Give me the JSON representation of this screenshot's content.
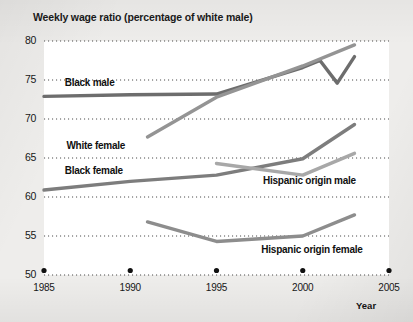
{
  "chart_data": {
    "type": "line",
    "title": "Weekly wage ratio (percentage of white male)",
    "xlabel": "Year",
    "ylabel": "",
    "xlim": [
      1985,
      2005
    ],
    "ylim": [
      50,
      80
    ],
    "yticks": [
      50,
      55,
      60,
      65,
      70,
      75,
      80
    ],
    "xticks": [
      1985,
      1990,
      1995,
      2000,
      2005
    ],
    "grid": "horizontal-dotted",
    "legend": "inline-labels",
    "series": [
      {
        "name": "Black male",
        "color": "#6d6d6d",
        "label_x": 1986.2,
        "label_y": 74.6,
        "x": [
          1985,
          1990,
          1995,
          2000,
          2001,
          2002,
          2003
        ],
        "values": [
          72.9,
          73.1,
          73.2,
          76.6,
          77.5,
          74.6,
          78.0
        ]
      },
      {
        "name": "White female",
        "color": "#949494",
        "label_x": 1986.3,
        "label_y": 66.6,
        "x": [
          1991,
          1995,
          2000,
          2003
        ],
        "values": [
          67.7,
          72.8,
          76.8,
          79.5
        ]
      },
      {
        "name": "Black female",
        "color": "#7d7d7d",
        "label_x": 1986.2,
        "label_y": 63.3,
        "x": [
          1985,
          1990,
          1995,
          2000,
          2003
        ],
        "values": [
          60.9,
          62.0,
          62.8,
          64.9,
          69.3
        ]
      },
      {
        "name": "Hispanic origin male",
        "color": "#a8a8a8",
        "label_x": 1997.7,
        "label_y": 62.1,
        "x": [
          1995,
          2000,
          2003
        ],
        "values": [
          64.3,
          62.8,
          65.6
        ]
      },
      {
        "name": "Hispanic origin female",
        "color": "#8d8d8d",
        "label_x": 1997.6,
        "label_y": 53.2,
        "x": [
          1991,
          1995,
          2000,
          2003
        ],
        "values": [
          56.8,
          54.3,
          55.0,
          57.7
        ]
      }
    ]
  },
  "title": {
    "text": "Weekly wage ratio (percentage of white male)"
  },
  "axis": {
    "year_label": "Year"
  }
}
